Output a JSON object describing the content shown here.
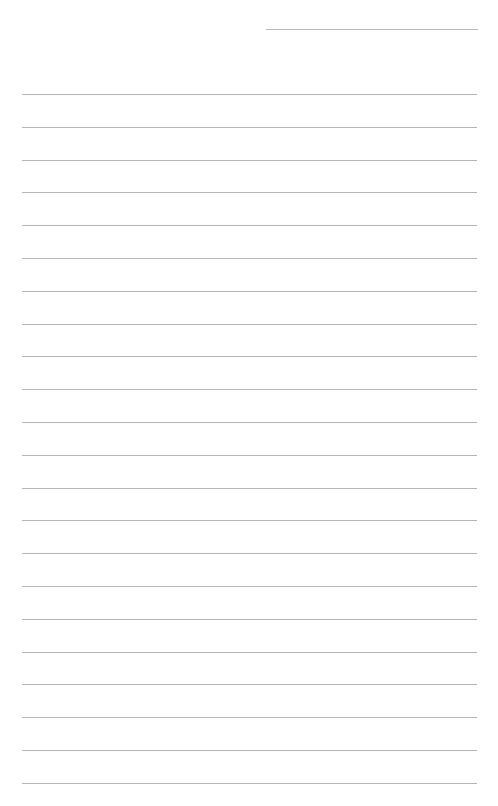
{
  "page": {
    "type": "lined-notebook-page",
    "background": "#ffffff",
    "line_color": "#b4b4b4",
    "header_line": {
      "label": "",
      "x": 266,
      "y": 29,
      "width": 212
    },
    "ruled_lines": {
      "count": 22,
      "first_y": 94,
      "spacing": 32.8,
      "x": 22,
      "width": 455
    }
  }
}
